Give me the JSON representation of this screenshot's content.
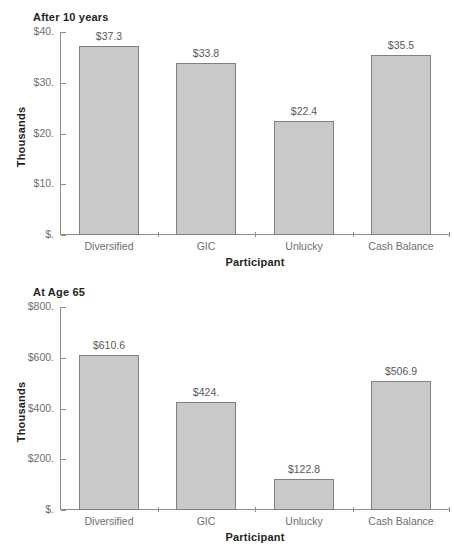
{
  "chart_data": [
    {
      "type": "bar",
      "title": "After 10 years",
      "xlabel": "Participant",
      "ylabel": "Thousands",
      "categories": [
        "Diversified",
        "GIC",
        "Unlucky",
        "Cash Balance"
      ],
      "values": [
        37.3,
        33.8,
        22.4,
        35.5
      ],
      "data_labels": [
        "$37.3",
        "$33.8",
        "$22.4",
        "$35.5"
      ],
      "ylim": [
        0,
        40
      ],
      "yticks": [
        0,
        10,
        20,
        30,
        40
      ],
      "ytick_labels": [
        "$.",
        "$10.",
        "$20.",
        "$30.",
        "$40."
      ],
      "grid": false,
      "legend": "none",
      "bar_color": "#c9c9c9",
      "bar_border_color": "#808080"
    },
    {
      "type": "bar",
      "title": "At Age 65",
      "xlabel": "Participant",
      "ylabel": "Thousands",
      "categories": [
        "Diversified",
        "GIC",
        "Unlucky",
        "Cash Balance"
      ],
      "values": [
        610.6,
        424.0,
        122.8,
        506.9
      ],
      "data_labels": [
        "$610.6",
        "$424.",
        "$122.8",
        "$506.9"
      ],
      "ylim": [
        0,
        800
      ],
      "yticks": [
        0,
        200,
        400,
        600,
        800
      ],
      "ytick_labels": [
        "$.",
        "$200.",
        "$400.",
        "$600.",
        "$800."
      ],
      "grid": false,
      "legend": "none",
      "bar_color": "#c9c9c9",
      "bar_border_color": "#808080"
    }
  ]
}
